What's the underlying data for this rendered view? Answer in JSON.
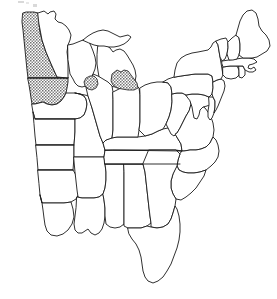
{
  "figure": {
    "title": "Map of the eastern and central United States",
    "background_color": "#ffffff",
    "outline_color": "#1a1a1a",
    "shading_pattern": "stipple-dots",
    "shading_color": "#6e6e6e",
    "width": 277,
    "height": 299
  },
  "legend": {
    "shaded_label": "Shaded (stippled) region",
    "unshaded_label": "Unshaded region"
  },
  "shaded_states": [
    "North Dakota",
    "South Dakota"
  ],
  "shaded_water": [
    "Lake Michigan southern bay",
    "Saginaw Bay / Lake Erie area"
  ],
  "states": [
    {
      "id": "north-dakota",
      "name": "North Dakota",
      "abbr": "ND",
      "shaded": true
    },
    {
      "id": "south-dakota",
      "name": "South Dakota",
      "abbr": "SD",
      "shaded": true
    },
    {
      "id": "minnesota",
      "name": "Minnesota",
      "abbr": "MN",
      "shaded": false
    },
    {
      "id": "wisconsin",
      "name": "Wisconsin",
      "abbr": "WI",
      "shaded": false
    },
    {
      "id": "michigan",
      "name": "Michigan",
      "abbr": "MI",
      "shaded": false
    },
    {
      "id": "iowa",
      "name": "Iowa",
      "abbr": "IA",
      "shaded": false
    },
    {
      "id": "nebraska",
      "name": "Nebraska",
      "abbr": "NE",
      "shaded": false
    },
    {
      "id": "kansas",
      "name": "Kansas",
      "abbr": "KS",
      "shaded": false
    },
    {
      "id": "oklahoma",
      "name": "Oklahoma",
      "abbr": "OK",
      "shaded": false
    },
    {
      "id": "texas",
      "name": "Texas",
      "abbr": "TX",
      "shaded": false
    },
    {
      "id": "missouri",
      "name": "Missouri",
      "abbr": "MO",
      "shaded": false
    },
    {
      "id": "arkansas",
      "name": "Arkansas",
      "abbr": "AR",
      "shaded": false
    },
    {
      "id": "louisiana",
      "name": "Louisiana",
      "abbr": "LA",
      "shaded": false
    },
    {
      "id": "mississippi",
      "name": "Mississippi",
      "abbr": "MS",
      "shaded": false
    },
    {
      "id": "alabama",
      "name": "Alabama",
      "abbr": "AL",
      "shaded": false
    },
    {
      "id": "tennessee",
      "name": "Tennessee",
      "abbr": "TN",
      "shaded": false
    },
    {
      "id": "kentucky",
      "name": "Kentucky",
      "abbr": "KY",
      "shaded": false
    },
    {
      "id": "illinois",
      "name": "Illinois",
      "abbr": "IL",
      "shaded": false
    },
    {
      "id": "indiana",
      "name": "Indiana",
      "abbr": "IN",
      "shaded": false
    },
    {
      "id": "ohio",
      "name": "Ohio",
      "abbr": "OH",
      "shaded": false
    },
    {
      "id": "west-virginia",
      "name": "West Virginia",
      "abbr": "WV",
      "shaded": false
    },
    {
      "id": "virginia",
      "name": "Virginia",
      "abbr": "VA",
      "shaded": false
    },
    {
      "id": "maryland",
      "name": "Maryland",
      "abbr": "MD",
      "shaded": false
    },
    {
      "id": "delaware",
      "name": "Delaware",
      "abbr": "DE",
      "shaded": false
    },
    {
      "id": "pennsylvania",
      "name": "Pennsylvania",
      "abbr": "PA",
      "shaded": false
    },
    {
      "id": "new-jersey",
      "name": "New Jersey",
      "abbr": "NJ",
      "shaded": false
    },
    {
      "id": "new-york",
      "name": "New York",
      "abbr": "NY",
      "shaded": false
    },
    {
      "id": "connecticut",
      "name": "Connecticut",
      "abbr": "CT",
      "shaded": false
    },
    {
      "id": "rhode-island",
      "name": "Rhode Island",
      "abbr": "RI",
      "shaded": false
    },
    {
      "id": "massachusetts",
      "name": "Massachusetts",
      "abbr": "MA",
      "shaded": false
    },
    {
      "id": "vermont",
      "name": "Vermont",
      "abbr": "VT",
      "shaded": false
    },
    {
      "id": "new-hampshire",
      "name": "New Hampshire",
      "abbr": "NH",
      "shaded": false
    },
    {
      "id": "maine",
      "name": "Maine",
      "abbr": "ME",
      "shaded": false
    },
    {
      "id": "north-carolina",
      "name": "North Carolina",
      "abbr": "NC",
      "shaded": false
    },
    {
      "id": "south-carolina",
      "name": "South Carolina",
      "abbr": "SC",
      "shaded": false
    },
    {
      "id": "georgia",
      "name": "Georgia",
      "abbr": "GA",
      "shaded": false
    },
    {
      "id": "florida",
      "name": "Florida",
      "abbr": "FL",
      "shaded": false
    }
  ]
}
